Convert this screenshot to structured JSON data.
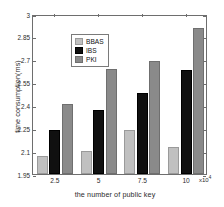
{
  "chart_data": {
    "type": "bar",
    "title": "",
    "subtitle": "",
    "xlabel": "the number of public key",
    "ylabel": "time consumption(ms)",
    "x_multiplier": "x10",
    "x_multiplier_exp": "4",
    "categories": [
      "2.5",
      "5",
      "7.5",
      "10"
    ],
    "series": [
      {
        "name": "BBAS",
        "color": "#c0c0c0",
        "values": [
          2.065,
          2.1,
          2.24,
          2.13
        ]
      },
      {
        "name": "IBS",
        "color": "#101010",
        "values": [
          2.24,
          2.37,
          2.48,
          2.63
        ]
      },
      {
        "name": "PKI",
        "color": "#8a8a8a",
        "values": [
          2.41,
          2.64,
          2.69,
          2.91
        ]
      }
    ],
    "ylim": [
      1.95,
      3.0
    ],
    "yticks": [
      "1.95",
      "2.1",
      "2.25",
      "2.4",
      "2.55",
      "2.7",
      "2.85",
      "3"
    ],
    "ytick_values": [
      1.95,
      2.1,
      2.25,
      2.4,
      2.55,
      2.7,
      2.85,
      3.0
    ],
    "grid": false,
    "legend_position": "upper-left",
    "legend_entries": [
      "BBAS",
      "IBS",
      "PKI"
    ],
    "annotations": []
  }
}
